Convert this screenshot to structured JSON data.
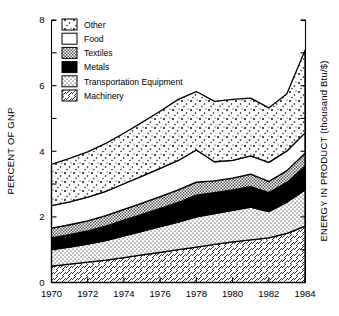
{
  "chart_data": {
    "type": "area",
    "stacked": true,
    "title": "",
    "xlabel": "",
    "ylabel": "PERCENT OF GNP",
    "y2label": "ENERGY IN PRODUCT (thousand Btu/$)",
    "x": [
      1970,
      1971,
      1972,
      1973,
      1974,
      1975,
      1976,
      1977,
      1978,
      1979,
      1980,
      1981,
      1982,
      1983,
      1984
    ],
    "xlim": [
      1970,
      1984
    ],
    "ylim": [
      0,
      8
    ],
    "xticks": [
      1970,
      1972,
      1974,
      1976,
      1978,
      1980,
      1982,
      1984
    ],
    "xtick_labels": [
      "1970",
      "1972",
      "1974",
      "1976",
      "1978",
      "1980",
      "1982",
      "1984"
    ],
    "yticks": [
      0,
      2,
      4,
      6,
      8
    ],
    "ytick_labels": [
      "0",
      "2",
      "4",
      "6",
      "8"
    ],
    "yticks_minor": [
      1,
      3,
      5,
      7
    ],
    "grid": false,
    "legend_position": "upper-left",
    "series": [
      {
        "name": "Machinery",
        "pattern": "diagonal-hatch",
        "values": [
          0.5,
          0.56,
          0.62,
          0.68,
          0.76,
          0.84,
          0.92,
          1.0,
          1.08,
          1.16,
          1.24,
          1.3,
          1.36,
          1.5,
          1.72
        ]
      },
      {
        "name": "Transportation Equipment",
        "pattern": "fine-dots",
        "values": [
          0.5,
          0.52,
          0.55,
          0.6,
          0.66,
          0.72,
          0.78,
          0.84,
          0.92,
          0.94,
          0.96,
          1.0,
          0.8,
          0.95,
          1.1
        ]
      },
      {
        "name": "Metals",
        "pattern": "solid-black",
        "values": [
          0.36,
          0.38,
          0.4,
          0.44,
          0.48,
          0.52,
          0.56,
          0.6,
          0.66,
          0.64,
          0.62,
          0.62,
          0.58,
          0.6,
          0.72
        ]
      },
      {
        "name": "Textiles",
        "pattern": "gray-checker",
        "values": [
          0.3,
          0.3,
          0.31,
          0.32,
          0.33,
          0.34,
          0.36,
          0.38,
          0.4,
          0.36,
          0.36,
          0.38,
          0.34,
          0.36,
          0.4
        ]
      },
      {
        "name": "Food",
        "pattern": "white",
        "values": [
          0.68,
          0.7,
          0.72,
          0.74,
          0.78,
          0.82,
          0.86,
          0.9,
          0.98,
          0.58,
          0.54,
          0.56,
          0.58,
          0.6,
          0.62
        ]
      },
      {
        "name": "Other",
        "pattern": "sparse-dots",
        "values": [
          1.26,
          1.32,
          1.38,
          1.46,
          1.54,
          1.64,
          1.74,
          1.86,
          1.78,
          1.84,
          1.86,
          1.76,
          1.66,
          1.74,
          2.52
        ]
      }
    ],
    "cumulative_top": [
      3.6,
      3.78,
      3.98,
      4.24,
      4.55,
      4.88,
      5.22,
      5.58,
      5.82,
      5.52,
      5.58,
      5.62,
      5.32,
      5.75,
      7.08
    ],
    "stack_order_bottom_to_top": [
      "Machinery",
      "Transportation Equipment",
      "Metals",
      "Textiles",
      "Food",
      "Other"
    ]
  },
  "legend": {
    "items": [
      {
        "label": "Other",
        "pattern": "sparse-dots"
      },
      {
        "label": "Food",
        "pattern": "white"
      },
      {
        "label": "Textiles",
        "pattern": "gray-checker"
      },
      {
        "label": "Metals",
        "pattern": "solid-black"
      },
      {
        "label": "Transportation Equipment",
        "pattern": "fine-dots"
      },
      {
        "label": "Machinery",
        "pattern": "diagonal-hatch"
      }
    ]
  },
  "axes": {
    "left_title": "PERCENT OF GNP",
    "right_title": "ENERGY IN PRODUCT (thousand Btu/$)"
  },
  "colors": {
    "ink": "#000000",
    "background": "#ffffff",
    "gray_fill": "#c8c8c8",
    "black_fill": "#000000"
  }
}
